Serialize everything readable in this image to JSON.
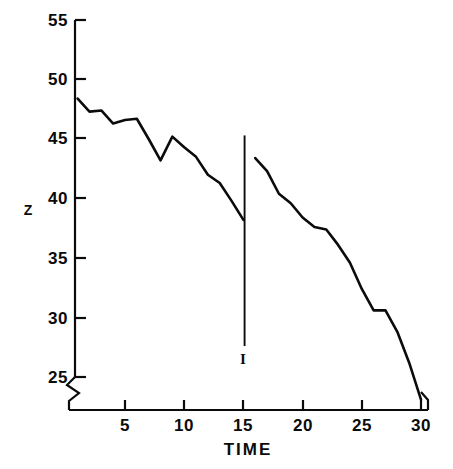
{
  "chart_data": {
    "type": "line",
    "title": "",
    "xlabel": "TIME",
    "ylabel": "Z",
    "xlim": [
      0,
      30.5
    ],
    "ylim": [
      22.3,
      55
    ],
    "xticks": [
      5,
      10,
      15,
      20,
      25,
      30
    ],
    "xtick_labels": [
      "5",
      "10",
      "15",
      "20",
      "25",
      "30"
    ],
    "yticks": [
      25,
      30,
      35,
      40,
      45,
      50,
      55
    ],
    "ytick_labels": [
      "25",
      "30",
      "35",
      "40",
      "45",
      "50",
      "55"
    ],
    "grid": false,
    "legend": "none",
    "y_axis_break": {
      "present": true,
      "below_value": 25,
      "note": "zig-zag break symbol on Y axis below 25"
    },
    "annotations": [
      {
        "name": "error-bar",
        "type": "vertical-line",
        "x": 15.1,
        "y_top": 45.3,
        "y_bottom": 27.6
      },
      {
        "name": "error-bar-cap-label",
        "type": "text",
        "text": "I",
        "x": 15.1,
        "y": 26.7
      }
    ],
    "series": [
      {
        "name": "Z segment 1",
        "x": [
          1,
          2,
          3,
          4,
          5,
          6,
          7,
          8,
          9,
          10,
          11,
          12,
          13,
          14,
          15
        ],
        "values": [
          48.4,
          47.3,
          47.4,
          46.3,
          46.6,
          46.7,
          45.0,
          43.2,
          45.2,
          44.3,
          43.5,
          42.0,
          41.3,
          39.8,
          38.2
        ]
      },
      {
        "name": "Z segment 2",
        "x": [
          16,
          17,
          18,
          19,
          20,
          21,
          22,
          23,
          24,
          25,
          26,
          27,
          28,
          29,
          30
        ],
        "values": [
          43.4,
          42.3,
          40.4,
          39.6,
          38.4,
          37.6,
          37.4,
          36.1,
          34.6,
          32.4,
          30.6,
          30.6,
          28.8,
          26.2,
          23.1
        ]
      }
    ]
  },
  "axis": {
    "x_label": "TIME",
    "y_label": "Z"
  },
  "marker": {
    "label": "I"
  }
}
